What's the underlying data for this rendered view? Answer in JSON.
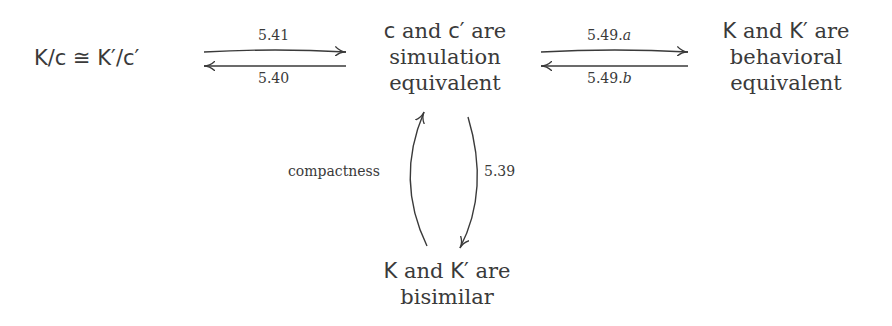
{
  "nodes": {
    "quotient": {
      "text": "K/c ≅ K′/c′"
    },
    "simulation": {
      "line1_a": "c",
      "line1_b": " and ",
      "line1_c": "c′",
      "line1_d": " are",
      "line2": "simulation",
      "line3": "equivalent"
    },
    "behavioral": {
      "line1_a": "K",
      "line1_b": " and ",
      "line1_c": "K′",
      "line1_d": " are",
      "line2": "behavioral",
      "line3": "equivalent"
    },
    "bisimilar": {
      "line1_a": "K",
      "line1_b": " and ",
      "line1_c": "K′",
      "line1_d": " are",
      "line2": "bisimilar"
    }
  },
  "edges": {
    "quot_to_sim": {
      "label": "5.41"
    },
    "sim_to_quot": {
      "label": "5.40"
    },
    "sim_to_beh": {
      "label_num": "5.49.",
      "label_sub": "a"
    },
    "beh_to_sim": {
      "label_num": "5.49.",
      "label_sub": "b"
    },
    "bisim_to_sim": {
      "label": "compactness"
    },
    "sim_to_bisim": {
      "label": "5.39"
    }
  },
  "colors": {
    "ink": "#3a3a3a",
    "background": "#ffffff"
  }
}
